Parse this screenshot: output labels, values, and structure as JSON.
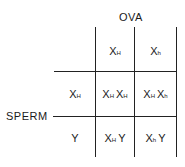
{
  "title_top": "OVA",
  "title_left": "SPERM",
  "ova_alleles": [
    {
      "base": "X",
      "sub": "H"
    },
    {
      "base": "X",
      "sub": "h"
    }
  ],
  "sperm_alleles": [
    {
      "base": "X",
      "sub": "H"
    },
    {
      "base": "Y",
      "sub": ""
    }
  ],
  "grid": [
    [
      [
        {
          "base": "X",
          "sub": "H"
        },
        {
          "base": "X",
          "sub": "H"
        }
      ],
      [
        {
          "base": "X",
          "sub": "H"
        },
        {
          "base": "X",
          "sub": "h"
        }
      ]
    ],
    [
      [
        {
          "base": "X",
          "sub": "H"
        },
        {
          "base": "Y",
          "sub": ""
        }
      ],
      [
        {
          "base": "X",
          "sub": "h"
        },
        {
          "base": "Y",
          "sub": ""
        }
      ]
    ]
  ],
  "colors": {
    "line": "#222222",
    "text": "#1a1a1a",
    "background": "#ffffff"
  }
}
